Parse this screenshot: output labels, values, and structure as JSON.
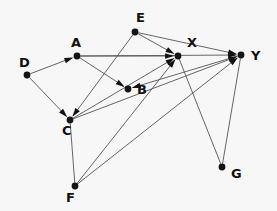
{
  "figure": {
    "kind": "directed-graph",
    "width": 277,
    "height": 211,
    "background_color": "#f7f7f7",
    "edge_color": "#555555",
    "node_color": "#151515",
    "label_color": "#111111"
  },
  "graph_data": {
    "type": "directed-graph",
    "title": "",
    "directed": true,
    "node_radius": 3.4,
    "arrow_length": 9,
    "arrow_width": 5.5,
    "nodes": [
      {
        "id": "A",
        "label": "A",
        "x": 77,
        "y": 56,
        "label_x": 71,
        "label_y": 43
      },
      {
        "id": "B",
        "label": "B",
        "x": 128,
        "y": 89,
        "label_x": 137,
        "label_y": 90
      },
      {
        "id": "C",
        "label": "C",
        "x": 70,
        "y": 120,
        "label_x": 62,
        "label_y": 131
      },
      {
        "id": "D",
        "label": "D",
        "x": 27,
        "y": 75,
        "label_x": 19,
        "label_y": 63
      },
      {
        "id": "E",
        "label": "E",
        "x": 135,
        "y": 32,
        "label_x": 136,
        "label_y": 18
      },
      {
        "id": "F",
        "label": "F",
        "x": 75,
        "y": 186,
        "label_x": 66,
        "label_y": 198
      },
      {
        "id": "G",
        "label": "G",
        "x": 222,
        "y": 167,
        "label_x": 231,
        "label_y": 174
      },
      {
        "id": "X",
        "label": "X",
        "x": 178,
        "y": 56,
        "label_x": 187,
        "label_y": 43
      },
      {
        "id": "Y",
        "label": "Y",
        "x": 241,
        "y": 55,
        "label_x": 251,
        "label_y": 56
      }
    ],
    "edges": [
      {
        "source": "D",
        "target": "A",
        "arrow": true
      },
      {
        "source": "D",
        "target": "C",
        "arrow": true
      },
      {
        "source": "A",
        "target": "B",
        "arrow": true
      },
      {
        "source": "A",
        "target": "X",
        "arrow": true
      },
      {
        "source": "A",
        "target": "Y",
        "arrow": true
      },
      {
        "source": "E",
        "target": "C",
        "arrow": true
      },
      {
        "source": "E",
        "target": "X",
        "arrow": true
      },
      {
        "source": "E",
        "target": "Y",
        "arrow": true
      },
      {
        "source": "C",
        "target": "X",
        "arrow": true
      },
      {
        "source": "C",
        "target": "Y",
        "arrow": true
      },
      {
        "source": "C",
        "target": "F",
        "arrow": false
      },
      {
        "source": "F",
        "target": "X",
        "arrow": true
      },
      {
        "source": "F",
        "target": "Y",
        "arrow": true
      },
      {
        "source": "Y",
        "target": "B",
        "arrow": true
      },
      {
        "source": "X",
        "target": "G",
        "arrow": false
      },
      {
        "source": "Y",
        "target": "G",
        "arrow": false
      }
    ]
  }
}
